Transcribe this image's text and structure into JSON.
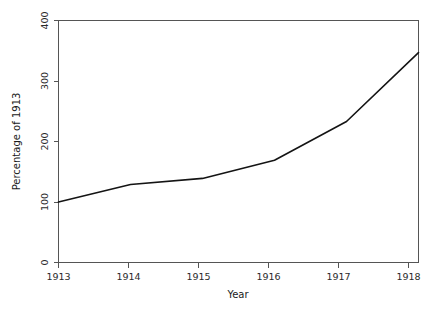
{
  "chart_data": {
    "type": "line",
    "title": "",
    "xlabel": "Year",
    "ylabel": "Percentage of 1913",
    "x": [
      1913,
      1914,
      1915,
      1916,
      1917,
      1918
    ],
    "xtick_labels": [
      "1913",
      "1914",
      "1915",
      "1916",
      "1917",
      "1918"
    ],
    "ytick_labels": [
      "0",
      "100",
      "200",
      "300",
      "400"
    ],
    "ytick_values": [
      0,
      100,
      200,
      300,
      400
    ],
    "values": [
      100,
      129,
      139,
      169,
      233,
      347
    ],
    "series": [
      {
        "name": "Percentage of 1913",
        "values": [
          100,
          129,
          139,
          169,
          233,
          347
        ]
      }
    ],
    "xlim": [
      1913,
      1918
    ],
    "ylim": [
      0,
      400
    ],
    "grid": false,
    "legend": false,
    "line_color": "#141414",
    "axis_color": "#555555",
    "background_color": "#ffffff"
  },
  "axes": {
    "x_title": "Year",
    "y_title": "Percentage of 1913"
  }
}
